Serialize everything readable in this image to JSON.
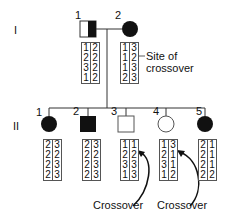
{
  "generations": {
    "I": "I",
    "II": "II"
  },
  "generation_I": [
    {
      "number": "1",
      "sex": "male",
      "affected": "half",
      "haplotypes": [
        [
          "1",
          "2"
        ],
        [
          "2",
          "2"
        ],
        [
          "3",
          "2"
        ],
        [
          "1",
          "2"
        ]
      ]
    },
    {
      "number": "2",
      "sex": "female",
      "affected": "full",
      "haplotypes": [
        [
          "1",
          "3"
        ],
        [
          "1",
          "2"
        ],
        [
          "1",
          "3"
        ],
        [
          "2",
          "3"
        ]
      ]
    }
  ],
  "generation_II": [
    {
      "number": "1",
      "sex": "female",
      "affected": "full",
      "haplotypes": [
        [
          "2",
          "3"
        ],
        [
          "2",
          "2"
        ],
        [
          "2",
          "3"
        ],
        [
          "2",
          "3"
        ]
      ]
    },
    {
      "number": "2",
      "sex": "male",
      "affected": "full",
      "haplotypes": [
        [
          "2",
          "3"
        ],
        [
          "2",
          "2"
        ],
        [
          "2",
          "3"
        ],
        [
          "2",
          "3"
        ]
      ]
    },
    {
      "number": "3",
      "sex": "male",
      "affected": "none",
      "haplotypes": [
        [
          "1",
          "1"
        ],
        [
          "2",
          "2"
        ],
        [
          "3",
          "3"
        ],
        [
          "1",
          "3"
        ]
      ]
    },
    {
      "number": "4",
      "sex": "female",
      "affected": "none",
      "haplotypes": [
        [
          "1",
          "3"
        ],
        [
          "2",
          "1"
        ],
        [
          "3",
          "1"
        ],
        [
          "1",
          "2"
        ]
      ]
    },
    {
      "number": "5",
      "sex": "female",
      "affected": "full",
      "haplotypes": [
        [
          "2",
          "1"
        ],
        [
          "2",
          "1"
        ],
        [
          "2",
          "1"
        ],
        [
          "2",
          "2"
        ]
      ]
    }
  ],
  "annotations": {
    "site_of_crossover": "Site of crossover",
    "site_line1": "Site of",
    "site_line2": "crossover",
    "crossover_1": "Crossover",
    "crossover_2": "Crossover"
  }
}
